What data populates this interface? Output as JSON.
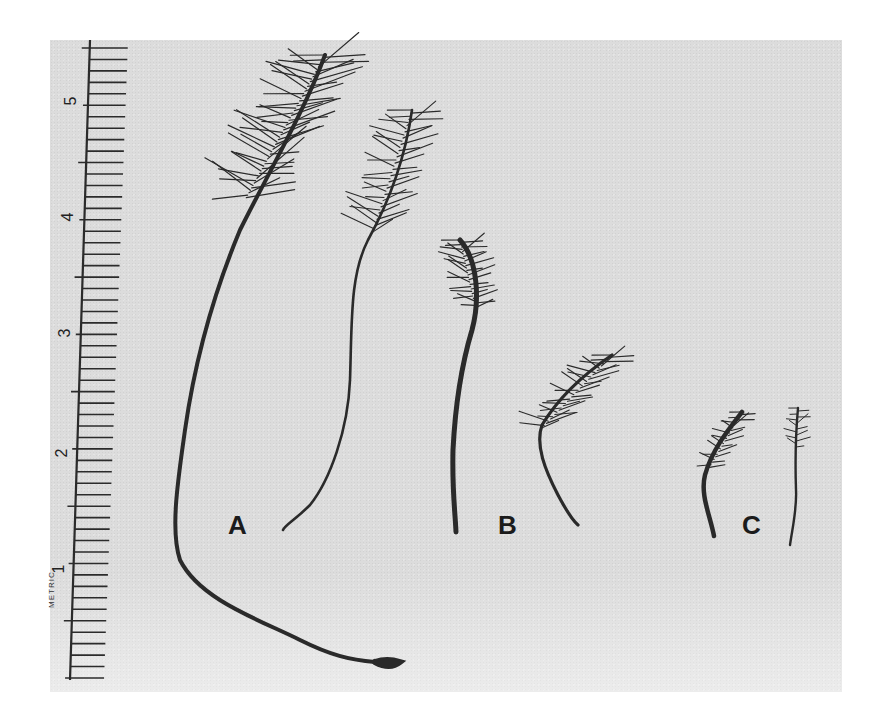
{
  "figure": {
    "ruler": {
      "unit_label": "METRIC",
      "major_ticks": [
        "1",
        "2",
        "3",
        "4",
        "5"
      ]
    },
    "specimens": [
      {
        "label": "A",
        "count": 2
      },
      {
        "label": "B",
        "count": 2
      },
      {
        "label": "C",
        "count": 2
      }
    ],
    "colors": {
      "background": "#dcdcdc",
      "specimen": "#2a2a2a",
      "page": "#ffffff"
    }
  }
}
